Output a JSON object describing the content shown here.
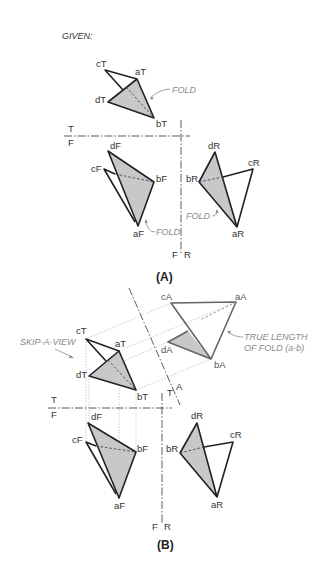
{
  "figure": {
    "given_label": "GIVEN:",
    "part_a": {
      "caption": "(A)",
      "top_view": {
        "points": {
          "cT": "cT",
          "aT": "aT",
          "dT": "dT",
          "bT": "bT"
        },
        "fold_note": "FOLD"
      },
      "fold_line_tf": {
        "upper": "T",
        "lower": "F"
      },
      "front_view": {
        "points": {
          "dF": "dF",
          "cF": "cF",
          "bF": "bF",
          "aF": "aF"
        },
        "fold_note": "FOLD"
      },
      "fold_line_fr": {
        "left": "F",
        "right": "R"
      },
      "right_view": {
        "points": {
          "dR": "dR",
          "cR": "cR",
          "bR": "bR",
          "aR": "aR"
        },
        "fold_note": "FOLD"
      }
    },
    "part_b": {
      "caption": "(B)",
      "skip_note": "SKIP-A-VIEW",
      "aux_view": {
        "points": {
          "cA": "cA",
          "aA": "aA",
          "dA": "dA",
          "bA": "bA"
        },
        "note_line1": "TRUE LENGTH",
        "note_line2": "OF FOLD (a-b)"
      },
      "fold_line_ta": {
        "t": "T",
        "a": "A"
      },
      "top_view": {
        "points": {
          "cT": "cT",
          "aT": "aT",
          "dT": "dT",
          "bT": "bT"
        }
      },
      "fold_line_tf": {
        "upper": "T",
        "lower": "F"
      },
      "front_view": {
        "points": {
          "dF": "dF",
          "cF": "cF",
          "bF": "bF",
          "aF": "aF"
        }
      },
      "fold_line_fr": {
        "left": "F",
        "right": "R"
      },
      "right_view": {
        "points": {
          "dR": "dR",
          "cR": "cR",
          "bR": "bR",
          "aR": "aR"
        }
      }
    }
  }
}
